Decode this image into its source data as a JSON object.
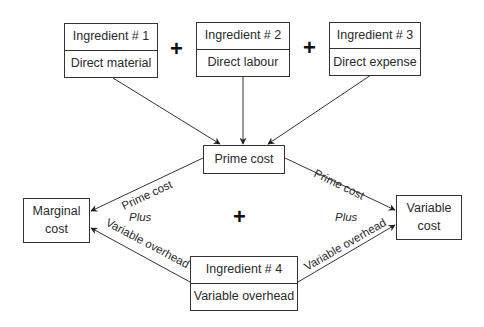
{
  "diagram": {
    "type": "flow",
    "ingredients": [
      {
        "title": "Ingredient # 1",
        "label": "Direct material"
      },
      {
        "title": "Ingredient # 2",
        "label": "Direct labour"
      },
      {
        "title": "Ingredient # 3",
        "label": "Direct expense"
      },
      {
        "title": "Ingredient # 4",
        "label": "Variable overhead"
      }
    ],
    "operators": {
      "plus_1": "+",
      "plus_2": "+",
      "plus_center": "+"
    },
    "prime_cost": "Prime cost",
    "marginal_cost": {
      "line1": "Marginal",
      "line2": "cost"
    },
    "variable_cost": {
      "line1": "Variable",
      "line2": "cost"
    },
    "edge_labels": {
      "left_upper": "Prime cost",
      "left_plus": "Plus",
      "left_lower": "Variable overhead",
      "right_upper": "Prime cost",
      "right_plus": "Plus",
      "right_lower": "Variable overhead"
    }
  }
}
